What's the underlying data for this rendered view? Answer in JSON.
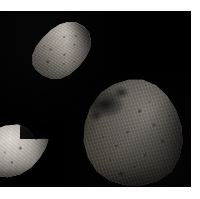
{
  "scene": {
    "kind": "astronomical-comparison-photograph",
    "background_color": "#000000",
    "page_color": "#ffffff",
    "plate": {
      "x": 0,
      "y": 11,
      "width": 191,
      "height": 176
    }
  },
  "bodies": [
    {
      "id": "gaspra",
      "name": "Gaspra",
      "position": "upper-left",
      "shape": "elongated irregular asteroid",
      "tone": "bright gray, strongly lit from upper right",
      "highlight_color": "#c9c4bc",
      "shadow_color": "#2b2925",
      "surface": "densely pitted with small craters, sharp terminator along lower-left limb"
    },
    {
      "id": "deimos",
      "name": "Deimos",
      "position": "lower-left",
      "shape": "rounded irregular body, cropped at the left frame edge",
      "tone": "brightest of the three, smooth high-albedo surface",
      "highlight_color": "#dedad3",
      "shadow_color": "#33312d",
      "surface": "smooth, two prominent small craters near center, concave notch at upper right"
    },
    {
      "id": "phobos",
      "name": "Phobos",
      "position": "lower-right",
      "shape": "large rounded irregular body, largest in the frame",
      "tone": "dark gray, low albedo",
      "highlight_color": "#7b766e",
      "shadow_color": "#191714",
      "surface": "heavily cratered; large shadowed basin at upper left, grooved regolith, crater cluster near bottom"
    }
  ]
}
